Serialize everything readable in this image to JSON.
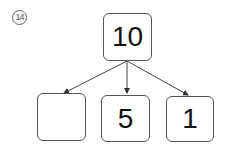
{
  "problem_label": "14",
  "diagram": {
    "top": {
      "value": "10"
    },
    "children": [
      {
        "value": ""
      },
      {
        "value": "5"
      },
      {
        "value": "1"
      }
    ]
  },
  "colors": {
    "stroke": "#555555",
    "text": "#111111"
  }
}
